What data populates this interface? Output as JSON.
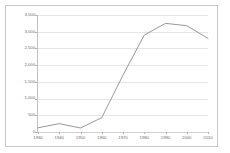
{
  "chart_data": {
    "type": "line",
    "title": "",
    "subtitle": "",
    "xlabel": "",
    "ylabel": "",
    "categories": [
      "1930",
      "1940",
      "1950",
      "1960",
      "1970",
      "1980",
      "1990",
      "2000",
      "2010"
    ],
    "values": [
      125,
      250,
      120,
      430,
      1700,
      2900,
      3250,
      3180,
      2800
    ],
    "series": [
      {
        "name": "Series 1",
        "values": [
          125,
          250,
          120,
          430,
          1700,
          2900,
          3250,
          3180,
          2800
        ]
      }
    ],
    "ylim": [
      0,
      3500
    ],
    "ytick_values": [
      0,
      500,
      1000,
      1500,
      2000,
      2500,
      3000,
      3500
    ],
    "ytick_labels": [
      "0",
      "500",
      "1,000",
      "1,500",
      "2,000",
      "2,500",
      "3,000",
      "3,500"
    ],
    "xtick_labels": [
      "1930",
      "1940",
      "1950",
      "1960",
      "1970",
      "1980",
      "1990",
      "2000",
      "2010"
    ],
    "grid": true,
    "grid_axis": "y",
    "legend": false,
    "legend_position": "none",
    "line_color": "#8c8c8c",
    "grid_color": "#e6e6e6",
    "axis_color": "#c0c0c0",
    "tick_label_color": "#6e6e6e",
    "border_color": "#c8c8c8",
    "background_color": "#ffffff",
    "annotations": []
  }
}
